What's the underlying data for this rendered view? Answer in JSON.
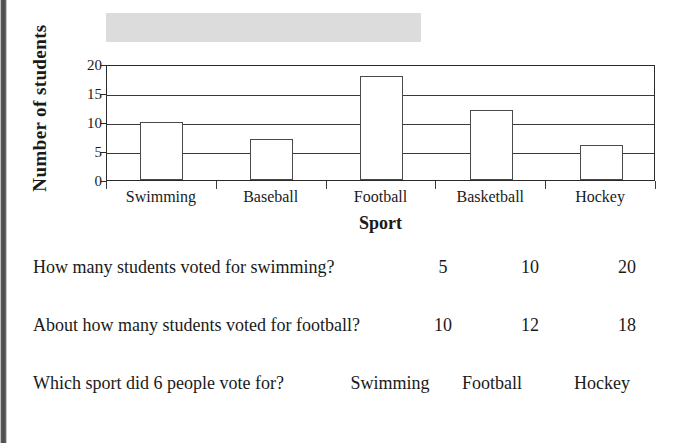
{
  "chart_data": {
    "type": "bar",
    "title": "",
    "title_redacted": true,
    "categories": [
      "Swimming",
      "Baseball",
      "Football",
      "Basketball",
      "Hockey"
    ],
    "values": [
      10,
      7,
      18,
      12,
      6
    ],
    "xlabel": "Sport",
    "ylabel": "Number of  students",
    "ylim": [
      0,
      20
    ],
    "yticks": [
      0,
      5,
      10,
      15,
      20
    ],
    "grid": true,
    "legend": "none",
    "bar_fill": "#ffffff",
    "bar_stroke": "#4a4a4a",
    "axis_color": "#2a2a2a"
  },
  "worksheet": {
    "questions": [
      {
        "text": "How many students voted for swimming?",
        "options": [
          "5",
          "10",
          "20"
        ]
      },
      {
        "text": "About how many students voted for football?",
        "options": [
          "10",
          "12",
          "18"
        ]
      },
      {
        "text": "Which sport did 6 people vote for?",
        "options": [
          "Swimming",
          "Football",
          "Hockey"
        ]
      }
    ]
  },
  "colors": {
    "page_background": "#ffffff",
    "redaction_banner": "#dcdcdc",
    "text": "#1a1a1a",
    "scan_edge": "#4a4a4a"
  }
}
